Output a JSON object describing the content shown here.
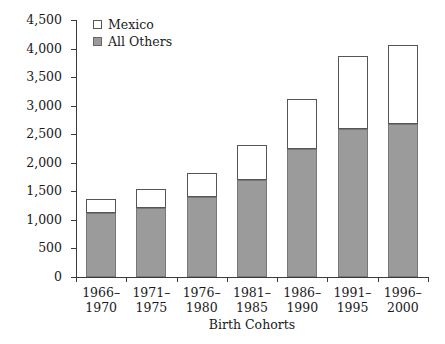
{
  "chart_data": {
    "type": "bar",
    "stacked": true,
    "title": "",
    "xlabel": "Birth Cohorts",
    "ylabel": "Number in Cohort, Thousands",
    "categories": [
      "1966–\n1970",
      "1971–\n1975",
      "1976–\n1980",
      "1981–\n1985",
      "1986–\n1990",
      "1991–\n1995",
      "1996–\n2000"
    ],
    "category_lines": [
      [
        "1966–",
        "1970"
      ],
      [
        "1971–",
        "1975"
      ],
      [
        "1976–",
        "1980"
      ],
      [
        "1981–",
        "1985"
      ],
      [
        "1986–",
        "1990"
      ],
      [
        "1991–",
        "1995"
      ],
      [
        "1996–",
        "2000"
      ]
    ],
    "series": [
      {
        "name": "All Others",
        "color": "#9b9b9b",
        "values": [
          1120,
          1210,
          1400,
          1700,
          2240,
          2590,
          2680
        ]
      },
      {
        "name": "Mexico",
        "color": "#ffffff",
        "values": [
          250,
          330,
          420,
          610,
          880,
          1280,
          1380
        ]
      }
    ],
    "totals": [
      1370,
      1540,
      1820,
      2310,
      3120,
      3870,
      4060
    ],
    "ylim": [
      0,
      4500
    ],
    "ytick_values": [
      0,
      500,
      1000,
      1500,
      2000,
      2500,
      3000,
      3500,
      4000,
      4500
    ],
    "ytick_labels": [
      "0",
      "500",
      "1,000",
      "1,500",
      "2,000",
      "2,500",
      "3,000",
      "3,500",
      "4,000",
      "4,500"
    ],
    "grid": false,
    "legend_position": "top-left",
    "legend_entries": [
      {
        "label": "Mexico",
        "swatch": "white"
      },
      {
        "label": "All Others",
        "swatch": "gray"
      }
    ]
  }
}
